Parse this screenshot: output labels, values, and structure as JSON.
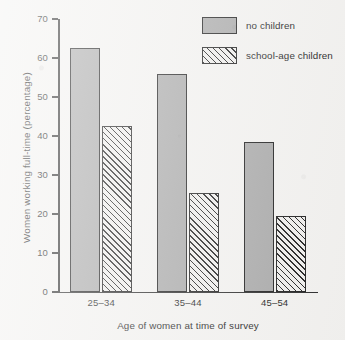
{
  "chart_data": {
    "type": "bar",
    "title": "",
    "xlabel": "Age of women at time of survey",
    "ylabel": "Women working full-time (percentage)",
    "categories": [
      "25–34",
      "35–44",
      "45–54"
    ],
    "series": [
      {
        "name": "no children",
        "values": [
          62.5,
          56,
          38.5
        ],
        "fill": "solid",
        "color": "#a9a9a9"
      },
      {
        "name": "school-age children",
        "values": [
          42.5,
          25.5,
          19.5
        ],
        "fill": "hatched",
        "color": "#f0efed"
      }
    ],
    "ylim": [
      0,
      70
    ],
    "yticks": [
      0,
      10,
      20,
      30,
      40,
      50,
      60,
      70
    ],
    "ytick_labels": [
      "0",
      "10",
      "20",
      "30",
      "40",
      "50",
      "60",
      "70"
    ],
    "grid": false,
    "legend_position": "top-right"
  },
  "legend": {
    "items": [
      {
        "label": "no children"
      },
      {
        "label": "school-age children"
      }
    ]
  },
  "axes": {
    "y_title": "Women working full-time (percentage)",
    "x_title": "Age of women at time of survey"
  },
  "colors": {
    "background": "#f3f2f0",
    "ink": "#1c1c1c",
    "bar_solid": "#a9a9a9",
    "bar_hatch_bg": "#f0efed"
  }
}
